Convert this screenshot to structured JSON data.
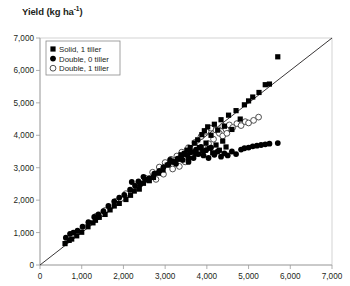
{
  "chart_data": {
    "type": "scatter",
    "title": "Yield (kg ha-1)",
    "title_main": "Yield (kg ha",
    "title_sup": "-1",
    "title_tail": ")",
    "xlabel": "",
    "ylabel": "Yield (kg ha-1)",
    "xlim": [
      0,
      7000
    ],
    "ylim": [
      0,
      7000
    ],
    "xticks": [
      0,
      1000,
      2000,
      3000,
      4000,
      5000,
      6000,
      7000
    ],
    "yticks": [
      0,
      1000,
      2000,
      3000,
      4000,
      5000,
      6000,
      7000
    ],
    "xtick_labels": [
      "0",
      "1,000",
      "2,000",
      "3,000",
      "4,000",
      "5,000",
      "6,000",
      "7,000"
    ],
    "ytick_labels": [
      "0",
      "1,000",
      "2,000",
      "3,000",
      "4,000",
      "5,000",
      "6,000",
      "7,000"
    ],
    "grid": false,
    "legend_position": "top-left",
    "reference_line": {
      "name": "1:1 line",
      "from": [
        0,
        0
      ],
      "to": [
        7000,
        7000
      ]
    },
    "series": [
      {
        "name": "Solid, 1 tiller",
        "marker": "filled-square",
        "color": "#000000",
        "points": [
          [
            600,
            660
          ],
          [
            700,
            760
          ],
          [
            760,
            800
          ],
          [
            880,
            900
          ],
          [
            1000,
            1010
          ],
          [
            1150,
            1180
          ],
          [
            1270,
            1300
          ],
          [
            1330,
            1380
          ],
          [
            1420,
            1470
          ],
          [
            1560,
            1560
          ],
          [
            1680,
            1700
          ],
          [
            1780,
            1820
          ],
          [
            1900,
            1900
          ],
          [
            2060,
            2020
          ],
          [
            2170,
            2150
          ],
          [
            2260,
            2280
          ],
          [
            2380,
            2340
          ],
          [
            2480,
            2520
          ],
          [
            2620,
            2600
          ],
          [
            2720,
            2700
          ],
          [
            2840,
            2830
          ],
          [
            2950,
            2930
          ],
          [
            3050,
            3080
          ],
          [
            3180,
            3180
          ],
          [
            3300,
            3260
          ],
          [
            3380,
            3400
          ],
          [
            3460,
            3440
          ],
          [
            3520,
            3540
          ],
          [
            3560,
            3280
          ],
          [
            3600,
            3620
          ],
          [
            3650,
            3480
          ],
          [
            3700,
            3760
          ],
          [
            3740,
            3420
          ],
          [
            3780,
            3860
          ],
          [
            3820,
            3620
          ],
          [
            3880,
            4020
          ],
          [
            3900,
            3520
          ],
          [
            3940,
            4140
          ],
          [
            3980,
            3760
          ],
          [
            4020,
            4260
          ],
          [
            4060,
            3600
          ],
          [
            4100,
            4000
          ],
          [
            4140,
            3460
          ],
          [
            4180,
            4340
          ],
          [
            4220,
            3700
          ],
          [
            4260,
            4160
          ],
          [
            4300,
            3540
          ],
          [
            4340,
            4480
          ],
          [
            4380,
            3820
          ],
          [
            4420,
            4280
          ],
          [
            4460,
            3640
          ],
          [
            4520,
            4620
          ],
          [
            4600,
            4180
          ],
          [
            4700,
            4760
          ],
          [
            4800,
            4500
          ],
          [
            4900,
            4940
          ],
          [
            5000,
            5060
          ],
          [
            5100,
            5180
          ],
          [
            5250,
            5320
          ],
          [
            5400,
            5560
          ],
          [
            5500,
            5580
          ],
          [
            5700,
            6420
          ]
        ]
      },
      {
        "name": "Double, 0 tiller",
        "marker": "filled-circle",
        "color": "#000000",
        "points": [
          [
            620,
            840
          ],
          [
            720,
            960
          ],
          [
            800,
            1000
          ],
          [
            900,
            1060
          ],
          [
            1020,
            1180
          ],
          [
            1160,
            1320
          ],
          [
            1300,
            1480
          ],
          [
            1400,
            1560
          ],
          [
            1520,
            1660
          ],
          [
            1640,
            1820
          ],
          [
            1780,
            1960
          ],
          [
            1900,
            2080
          ],
          [
            2020,
            2160
          ],
          [
            2160,
            2320
          ],
          [
            2280,
            2440
          ],
          [
            2400,
            2480
          ],
          [
            2520,
            2640
          ],
          [
            2620,
            2680
          ],
          [
            2740,
            2820
          ],
          [
            2860,
            2900
          ],
          [
            2960,
            3020
          ],
          [
            3080,
            3100
          ],
          [
            3200,
            3180
          ],
          [
            3300,
            3280
          ],
          [
            3380,
            3340
          ],
          [
            3460,
            3420
          ],
          [
            3540,
            3380
          ],
          [
            3600,
            3480
          ],
          [
            3680,
            3300
          ],
          [
            3740,
            3560
          ],
          [
            3800,
            3420
          ],
          [
            3860,
            3640
          ],
          [
            3920,
            3380
          ],
          [
            3980,
            3540
          ],
          [
            4040,
            3300
          ],
          [
            4100,
            3620
          ],
          [
            4180,
            3400
          ],
          [
            4260,
            3500
          ],
          [
            4340,
            3340
          ],
          [
            4420,
            3440
          ],
          [
            4500,
            3380
          ],
          [
            4600,
            3500
          ],
          [
            4700,
            3420
          ],
          [
            4820,
            3560
          ],
          [
            4900,
            3600
          ],
          [
            5000,
            3620
          ],
          [
            5100,
            3660
          ],
          [
            5200,
            3680
          ],
          [
            5300,
            3700
          ],
          [
            5400,
            3720
          ],
          [
            5500,
            3740
          ],
          [
            5700,
            3760
          ],
          [
            2200,
            2560
          ],
          [
            2360,
            2580
          ],
          [
            2480,
            2720
          ],
          [
            3120,
            3240
          ],
          [
            3260,
            3120
          ],
          [
            3420,
            3240
          ],
          [
            3560,
            3180
          ]
        ]
      },
      {
        "name": "Double, 1 tiller",
        "marker": "open-circle",
        "color": "#ffffff",
        "points": [
          [
            1340,
            1500
          ],
          [
            1560,
            1680
          ],
          [
            1820,
            1960
          ],
          [
            2060,
            2200
          ],
          [
            2300,
            2440
          ],
          [
            2520,
            2680
          ],
          [
            2700,
            2860
          ],
          [
            2860,
            3020
          ],
          [
            3000,
            3160
          ],
          [
            3140,
            3260
          ],
          [
            3280,
            3360
          ],
          [
            3400,
            3480
          ],
          [
            3480,
            3180
          ],
          [
            3560,
            3620
          ],
          [
            3640,
            3340
          ],
          [
            3720,
            3780
          ],
          [
            3800,
            3460
          ],
          [
            3860,
            3960
          ],
          [
            3920,
            3600
          ],
          [
            3980,
            4120
          ],
          [
            4040,
            3740
          ],
          [
            4100,
            4220
          ],
          [
            4160,
            3880
          ],
          [
            4220,
            4160
          ],
          [
            4300,
            4060
          ],
          [
            4380,
            4280
          ],
          [
            4460,
            4180
          ],
          [
            4540,
            4320
          ],
          [
            4620,
            4240
          ],
          [
            4720,
            4360
          ],
          [
            4820,
            4300
          ],
          [
            4920,
            4420
          ],
          [
            5000,
            4380
          ],
          [
            5120,
            4460
          ],
          [
            5240,
            4560
          ],
          [
            3340,
            3040
          ],
          [
            3180,
            2960
          ],
          [
            2960,
            2800
          ],
          [
            2780,
            2640
          ],
          [
            4380,
            3980
          ],
          [
            4480,
            4060
          ]
        ]
      }
    ]
  },
  "legend": {
    "items": [
      {
        "label": "Solid, 1 tiller",
        "marker": "filled-square"
      },
      {
        "label": "Double, 0 tiller",
        "marker": "filled-circle"
      },
      {
        "label": "Double, 1 tiller",
        "marker": "open-circle"
      }
    ]
  }
}
